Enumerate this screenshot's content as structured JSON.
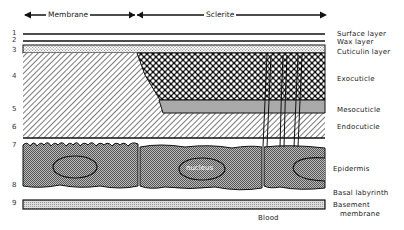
{
  "diagram": {
    "type": "insect cuticle cross-section",
    "top_labels": {
      "membrane": "Membrane",
      "sclerite": "Sclerite"
    },
    "layer_numbers": [
      "1",
      "2",
      "3",
      "4",
      "5",
      "6",
      "7",
      "8",
      "9"
    ],
    "layer_labels": {
      "surface": "Surface layer",
      "wax": "Wax layer",
      "cuticulin": "Cuticulin layer",
      "exocuticle": "Exocuticle",
      "mesocuticle": "Mesocuticle",
      "endocuticle": "Endocuticle",
      "epidermis": "Epidermis",
      "basal": "Basal labyrinth",
      "basement_1": "Basement",
      "basement_2": "membrane",
      "blood": "Blood"
    },
    "nucleus_label": "nucleus"
  }
}
